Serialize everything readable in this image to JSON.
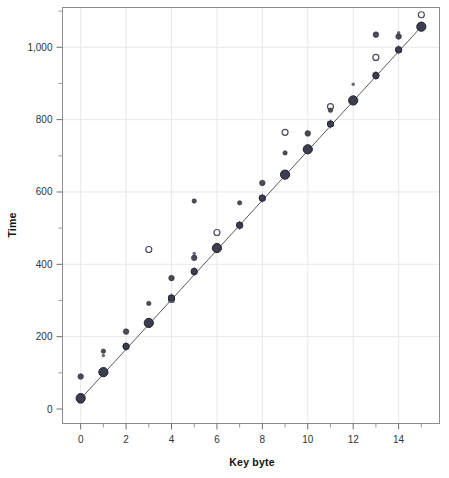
{
  "chart_data": {
    "type": "scatter",
    "title": "",
    "xlabel": "Key byte",
    "ylabel": "Time",
    "xlim": [
      -0.8,
      15.8
    ],
    "ylim": [
      -40,
      1110
    ],
    "grid": true,
    "legend": null,
    "x_ticks_major": [
      0,
      2,
      4,
      6,
      8,
      10,
      12,
      14
    ],
    "x_ticks_major_labels": [
      "0",
      "2",
      "4",
      "6",
      "8",
      "10",
      "12",
      "14"
    ],
    "x_ticks_minor": [
      1,
      3,
      5,
      7,
      9,
      11,
      13,
      15
    ],
    "y_ticks_major": [
      0,
      200,
      400,
      600,
      800,
      1000
    ],
    "y_ticks_major_labels": [
      "0",
      "200",
      "400",
      "600",
      "800",
      "1,000"
    ],
    "y_ticks_minor": [
      100,
      300,
      500,
      700,
      900,
      1100
    ],
    "trendline": {
      "name": "linear fit",
      "x": [
        0,
        15
      ],
      "y": [
        28,
        1057
      ],
      "slope": 68.6,
      "intercept": 28
    },
    "series": [
      {
        "name": "median timing (large filled circles)",
        "marker": "filled-circle-large",
        "x": [
          0,
          1,
          2,
          3,
          4,
          5,
          6,
          7,
          8,
          9,
          10,
          11,
          12,
          13,
          14,
          15
        ],
        "y": [
          30,
          102,
          173,
          238,
          307,
          380,
          445,
          508,
          583,
          648,
          718,
          788,
          853,
          922,
          993,
          1057
        ]
      },
      {
        "name": "secondary samples (small markers)",
        "marker": "small-circle",
        "points": [
          {
            "x": 0,
            "y": 90
          },
          {
            "x": 0,
            "y": 25
          },
          {
            "x": 1,
            "y": 160
          },
          {
            "x": 1,
            "y": 148
          },
          {
            "x": 2,
            "y": 214
          },
          {
            "x": 3,
            "y": 441
          },
          {
            "x": 3,
            "y": 292
          },
          {
            "x": 3,
            "y": 232
          },
          {
            "x": 4,
            "y": 362
          },
          {
            "x": 4,
            "y": 303
          },
          {
            "x": 5,
            "y": 575
          },
          {
            "x": 5,
            "y": 430
          },
          {
            "x": 5,
            "y": 418
          },
          {
            "x": 6,
            "y": 488
          },
          {
            "x": 7,
            "y": 570
          },
          {
            "x": 7,
            "y": 505
          },
          {
            "x": 8,
            "y": 625
          },
          {
            "x": 9,
            "y": 765
          },
          {
            "x": 9,
            "y": 708
          },
          {
            "x": 9,
            "y": 650
          },
          {
            "x": 10,
            "y": 762
          },
          {
            "x": 11,
            "y": 836
          },
          {
            "x": 11,
            "y": 826
          },
          {
            "x": 12,
            "y": 898
          },
          {
            "x": 13,
            "y": 1035
          },
          {
            "x": 13,
            "y": 972
          },
          {
            "x": 13,
            "y": 920
          },
          {
            "x": 14,
            "y": 1040
          },
          {
            "x": 14,
            "y": 1030
          },
          {
            "x": 15,
            "y": 1090
          }
        ]
      }
    ]
  },
  "axes": {
    "y_title": "Time",
    "x_title": "Key byte"
  }
}
